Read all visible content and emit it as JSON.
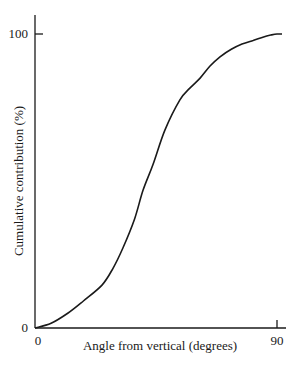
{
  "chart_data": {
    "type": "line",
    "title": "",
    "xlabel": "Angle from vertical (degrees)",
    "ylabel": "Cumulative contribution (%)",
    "xlim": [
      0,
      90
    ],
    "ylim": [
      0,
      100
    ],
    "x_ticks": [
      {
        "value": 0,
        "label": "0"
      },
      {
        "value": 90,
        "label": "90"
      }
    ],
    "y_ticks": [
      {
        "value": 0,
        "label": "0"
      },
      {
        "value": 100,
        "label": "100"
      }
    ],
    "grid": false,
    "legend": null,
    "series": [
      {
        "name": "Cumulative contribution",
        "color": "#1a1a1a",
        "x": [
          0,
          6,
          12.3,
          18,
          24.9,
          29,
          32.7,
          37,
          40.2,
          43.9,
          48.3,
          53.9,
          57.5,
          61.4,
          65,
          68.8,
          73,
          77,
          81.1,
          85,
          88,
          90
        ],
        "values": [
          0,
          1.6,
          5.1,
          9.2,
          14.6,
          20.3,
          27.2,
          37.0,
          46.9,
          55.6,
          67.3,
          77.6,
          81.5,
          85.0,
          89.0,
          92.2,
          94.8,
          96.6,
          97.8,
          99.0,
          99.7,
          100
        ]
      }
    ]
  },
  "plot": {
    "x0_px": 35,
    "x1_px": 277,
    "y0_px": 328,
    "y1_px": 34,
    "yaxis_top_px": 15,
    "xaxis_right_px": 286
  }
}
